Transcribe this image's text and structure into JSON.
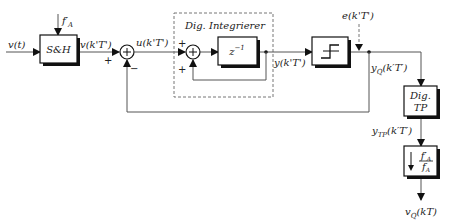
{
  "diagram": {
    "signals": {
      "input": "v(t)",
      "sample_rate_in": "f'_A",
      "sampled": "v(k'T')",
      "integrator_in": "u(k'T')",
      "integrator_out": "y(k'T')",
      "dither": "e(k'T')",
      "quantized": "y_Q(k'T')",
      "lowpass_out": "y_TP(k'T')",
      "output": "v_Q(kT)"
    },
    "blocks": {
      "sample_hold": "S&H",
      "delay": "z⁻¹",
      "quantizer": "quantizer",
      "lowpass_line1": "Dig.",
      "lowpass_line2": "TP",
      "downsampler_num": "f'_A",
      "downsampler_den": "f_A"
    },
    "groups": {
      "integrator_title": "Dig. Integrierer"
    },
    "signs": {
      "sum1_plus": "+",
      "sum1_minus": "−",
      "sum2_plus_top": "+",
      "sum2_plus_bottom": "+"
    }
  }
}
